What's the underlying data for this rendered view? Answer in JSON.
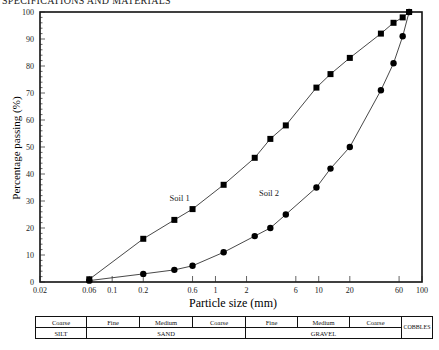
{
  "header": {
    "text": "SPECIFICATIONS AND MATERIALS"
  },
  "chart_data": {
    "type": "line",
    "title": "",
    "xlabel": "Particle size (mm)",
    "ylabel": "Percentage passing (%)",
    "xscale": "log",
    "xlim": [
      0.02,
      100
    ],
    "ylim": [
      0,
      100
    ],
    "x_ticks": [
      "0.02",
      "0.06",
      "0.1",
      "0.2",
      "0.6",
      "1",
      "2",
      "6",
      "10",
      "20",
      "60",
      "100"
    ],
    "y_ticks": [
      "0",
      "10",
      "20",
      "30",
      "40",
      "50",
      "60",
      "70",
      "80",
      "90",
      "100"
    ],
    "grid": false,
    "series": [
      {
        "name": "Soil 1",
        "marker": "square",
        "x": [
          0.06,
          0.2,
          0.4,
          0.6,
          1.2,
          2.4,
          3.4,
          4.8,
          9.5,
          13,
          20,
          40,
          53,
          65,
          75
        ],
        "y": [
          1,
          16,
          23,
          27,
          36,
          46,
          53,
          58,
          72,
          77,
          83,
          92,
          96,
          98,
          100
        ]
      },
      {
        "name": "Soil 2",
        "marker": "circle",
        "x": [
          0.06,
          0.2,
          0.4,
          0.6,
          1.2,
          2.4,
          3.4,
          4.8,
          9.5,
          13,
          20,
          40,
          53,
          65,
          75
        ],
        "y": [
          0.5,
          3,
          4.5,
          6,
          11,
          17,
          20,
          25,
          35,
          42,
          50,
          71,
          81,
          91,
          100
        ]
      }
    ],
    "annotations": [
      {
        "text": "Soil 1",
        "x": 0.45,
        "y": 30
      },
      {
        "text": "Soil 2",
        "x": 3.3,
        "y": 32
      }
    ]
  },
  "classification": {
    "sub_row": [
      "Coarse",
      "Fine",
      "Medium",
      "Coarse",
      "Fine",
      "Medium",
      "Coarse"
    ],
    "main_row": [
      "SILT",
      "SAND",
      "GRAVEL"
    ],
    "cobbles": "COBBLES"
  }
}
